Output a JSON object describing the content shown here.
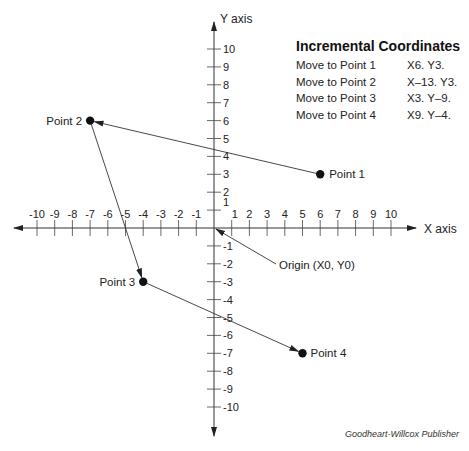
{
  "chart_data": {
    "type": "scatter",
    "title": "Incremental Coordinates",
    "xlabel": "X axis",
    "ylabel": "Y axis",
    "xlim": [
      -10,
      10
    ],
    "ylim": [
      -10,
      10
    ],
    "x_ticks": [
      -10,
      -9,
      -8,
      -7,
      -6,
      -5,
      -4,
      -3,
      -2,
      -1,
      1,
      2,
      3,
      4,
      5,
      6,
      7,
      8,
      9,
      10
    ],
    "y_ticks": [
      10,
      9,
      8,
      7,
      6,
      5,
      4,
      3,
      2,
      1,
      -1,
      -2,
      -3,
      -4,
      -5,
      -6,
      -7,
      -8,
      -9,
      -10
    ],
    "origin_label": "Origin (X0, Y0)",
    "points": [
      {
        "label": "Point 1",
        "x": 6,
        "y": 3
      },
      {
        "label": "Point 2",
        "x": -7,
        "y": 6
      },
      {
        "label": "Point 3",
        "x": -4,
        "y": -3
      },
      {
        "label": "Point 4",
        "x": 5,
        "y": -7
      }
    ],
    "path": [
      "Origin",
      "Point 1",
      "Point 2",
      "Point 3",
      "Point 4"
    ],
    "grid": false
  },
  "legend": {
    "title": "Incremental Coordinates",
    "rows": [
      {
        "move": "Move to Point 1",
        "coords": "X6. Y3."
      },
      {
        "move": "Move to Point 2",
        "coords": "X–13. Y3."
      },
      {
        "move": "Move to Point 3",
        "coords": "X3. Y–9."
      },
      {
        "move": "Move to Point 4",
        "coords": "X9. Y–4."
      }
    ]
  },
  "credit": "Goodheart-Willcox Publisher"
}
